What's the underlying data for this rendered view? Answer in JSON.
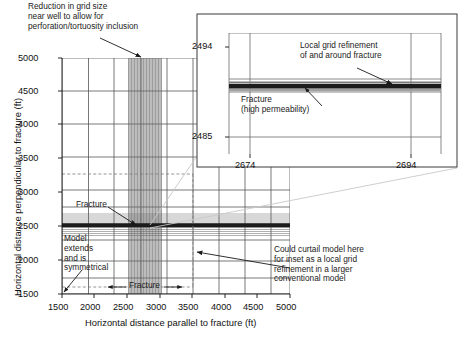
{
  "figure": {
    "type": "reservoir-grid-diagram",
    "background": "#ffffff",
    "line_color": "#4d4d4d",
    "dense_color": "#555555",
    "fracture_color": "#1a1a1a",
    "dashed_color": "#777777",
    "leader_color": "#bdbdbd"
  },
  "main_plot": {
    "xlabel": "Horizontal distance parallel to fracture (ft)",
    "ylabel": "Horizontal distance perpendicular to fracture (ft)",
    "xticks": [
      "1500",
      "2000",
      "2500",
      "3000",
      "3500",
      "4000",
      "4500",
      "5000"
    ],
    "yticks": [
      "1500",
      "2000",
      "2500",
      "3000",
      "3500",
      "4000",
      "4500",
      "5000"
    ],
    "xlim": [
      1500,
      5000
    ],
    "ylim": [
      1500,
      5000
    ],
    "fracture_y": 2500,
    "well_x": 2500,
    "refined_x_range": [
      2300,
      2700
    ],
    "curtail_box": [
      1500,
      1500,
      3600,
      3200
    ]
  },
  "inset": {
    "xticks": [
      "2674",
      "2694"
    ],
    "yticks": [
      "2485",
      "2494"
    ],
    "xlim": [
      2670,
      2698
    ],
    "ylim": [
      2483,
      2496
    ],
    "fracture_y": 2490
  },
  "annotations": {
    "grid_reduction": "Reduction in grid size\nnear well to allow for\nperforation/tortuosity inclusion",
    "local_refinement": "Local grid refinement\nof and around fracture",
    "fracture_perm": "Fracture\n(high permeability)",
    "fracture_main": "Fracture",
    "fracture_bottom": "Fracture",
    "model_extends": "Model\nextends\nand is\nsymmetrical",
    "curtail": "Could curtail model here\nfor inset as a local grid\nrefinement in a larger\nconventional model"
  }
}
